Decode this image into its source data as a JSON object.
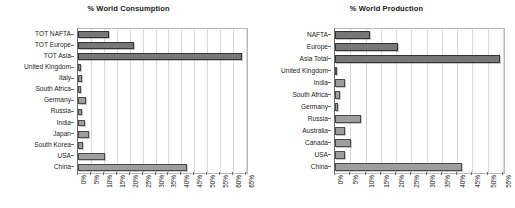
{
  "chart_data": [
    {
      "type": "bar",
      "orientation": "horizontal",
      "title": "% World Consumption",
      "xlabel": "",
      "ylabel": "",
      "xlim": [
        0,
        65
      ],
      "xticks": [
        "0%",
        "5%",
        "10%",
        "15%",
        "20%",
        "25%",
        "30%",
        "35%",
        "40%",
        "45%",
        "50%",
        "55%",
        "60%",
        "65%"
      ],
      "grid": true,
      "legend": "none",
      "categories": [
        "TOT NAFTA",
        "TOT Europe",
        "TOT Asia",
        "United Kingdom",
        "Italy",
        "South Africa",
        "Germany",
        "Russia",
        "India",
        "Japan",
        "South Korea",
        "USA",
        "China"
      ],
      "values": [
        12.0,
        21.5,
        63.5,
        1.0,
        1.5,
        1.3,
        3.2,
        1.5,
        2.6,
        4.2,
        1.8,
        10.5,
        42.0
      ],
      "series": [
        {
          "name": "% World Consumption",
          "values": [
            12.0,
            21.5,
            63.5,
            1.0,
            1.5,
            1.3,
            3.2,
            1.5,
            2.6,
            4.2,
            1.8,
            10.5,
            42.0
          ]
        }
      ],
      "emphasized_categories": [
        "TOT NAFTA",
        "TOT Europe",
        "TOT Asia"
      ]
    },
    {
      "type": "bar",
      "orientation": "horizontal",
      "title": "% World Production",
      "xlabel": "",
      "ylabel": "",
      "xlim": [
        0,
        55
      ],
      "xticks": [
        "0%",
        "5%",
        "10%",
        "15%",
        "20%",
        "25%",
        "30%",
        "35%",
        "40%",
        "45%",
        "50%",
        "55%"
      ],
      "grid": true,
      "legend": "none",
      "categories": [
        "NAFTA",
        "Europe",
        "Asia Total",
        "United Kingdom",
        "India",
        "South Africa",
        "Germany",
        "Russia",
        "Australia",
        "Canada",
        "USA",
        "China"
      ],
      "values": [
        11.5,
        20.5,
        54.0,
        0.6,
        3.4,
        1.6,
        1.0,
        8.5,
        3.2,
        5.4,
        3.2,
        41.5
      ],
      "series": [
        {
          "name": "% World Production",
          "values": [
            11.5,
            20.5,
            54.0,
            0.6,
            3.4,
            1.6,
            1.0,
            8.5,
            3.2,
            5.4,
            3.2,
            41.5
          ]
        }
      ],
      "emphasized_categories": [
        "NAFTA",
        "Europe",
        "Asia Total"
      ]
    }
  ],
  "colors": {
    "bar_light": "#9e9e9e",
    "bar_dark": "#777777",
    "bar_border": "#4a4a4a",
    "gridline": "#dadada",
    "axis": "#6f6f6f",
    "text": "#1d1d1d",
    "background": "#ffffff"
  }
}
